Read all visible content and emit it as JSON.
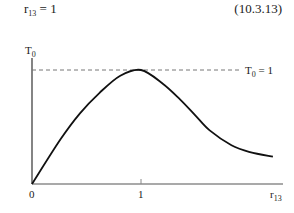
{
  "equation": {
    "lhs_base": "r",
    "lhs_sub": "13",
    "rhs": " = 1",
    "number": "(10.3.13)"
  },
  "chart_data": {
    "type": "line",
    "title": "",
    "xlabel": "r13",
    "ylabel": "T0",
    "x_ticks": [
      "0",
      "1"
    ],
    "reference_line": {
      "y": 1,
      "style": "dashed",
      "label": "T0 = 1"
    },
    "xlim": [
      0,
      2.3
    ],
    "ylim": [
      0,
      1.1
    ],
    "grid": false,
    "legend": "none",
    "series": [
      {
        "name": "T0(r13)",
        "x": [
          0,
          0.26,
          0.44,
          0.62,
          0.81,
          1.0,
          1.2,
          1.36,
          1.5,
          1.63,
          1.83,
          2.0,
          2.21
        ],
        "y": [
          0,
          0.39,
          0.62,
          0.8,
          0.95,
          1.0,
          0.88,
          0.74,
          0.6,
          0.47,
          0.34,
          0.28,
          0.24
        ]
      }
    ]
  },
  "labels": {
    "y_axis_base": "T",
    "y_axis_sub": "0",
    "x_axis_base": "r",
    "x_axis_sub": "13",
    "tick_0": "0",
    "tick_1": "1",
    "ref_base": "T",
    "ref_sub": "0",
    "ref_rhs": " = 1"
  }
}
